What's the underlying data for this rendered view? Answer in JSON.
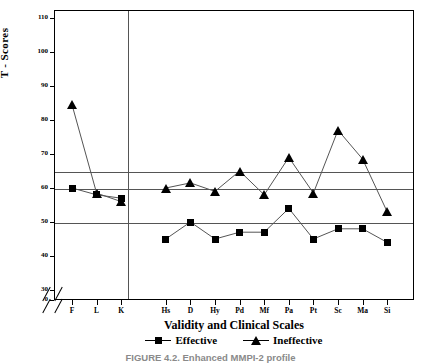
{
  "figure": {
    "caption": "FIGURE 4.2.  Enhanced MMPI-2 profile",
    "y_axis_title": "T - Scores",
    "x_axis_title": "Validity and Clinical Scales"
  },
  "legend": {
    "position": "bottom-center",
    "items": [
      {
        "label": "Effective",
        "marker": "square-marker"
      },
      {
        "label": "Ineffective",
        "marker": "triangle-marker"
      }
    ]
  },
  "chart_data": {
    "type": "line",
    "title": "",
    "xlabel": "Validity and Clinical Scales",
    "ylabel": "T - Scores",
    "categories": [
      "F",
      "L",
      "K",
      "Hs",
      "D",
      "Hy",
      "Pd",
      "Mf",
      "Pa",
      "Pt",
      "Sc",
      "Ma",
      "Si"
    ],
    "series": [
      {
        "name": "Effective",
        "marker": "square",
        "values": [
          60,
          58,
          57,
          45,
          50,
          45,
          47,
          47,
          54,
          45,
          48,
          48,
          44
        ]
      },
      {
        "name": "Ineffective",
        "marker": "triangle",
        "values": [
          84.5,
          58.5,
          56,
          60,
          61.5,
          59,
          65,
          58,
          69,
          58.5,
          77,
          68.5,
          53
        ]
      }
    ],
    "gap_after_category": "K",
    "ylim": [
      0,
      120
    ],
    "ytick_labels": [
      "0",
      "30",
      "40",
      "50",
      "60",
      "70",
      "80",
      "90",
      "100",
      "110",
      "120"
    ],
    "ytick_values": [
      0,
      30,
      40,
      50,
      60,
      70,
      80,
      90,
      100,
      110,
      120
    ],
    "axis_break": true,
    "axis_break_between": [
      0,
      30
    ],
    "reference_lines": [
      65,
      50
    ],
    "grid": false,
    "colors": {
      "line": "#555555",
      "marker": "#000000",
      "axis": "#000000"
    }
  }
}
